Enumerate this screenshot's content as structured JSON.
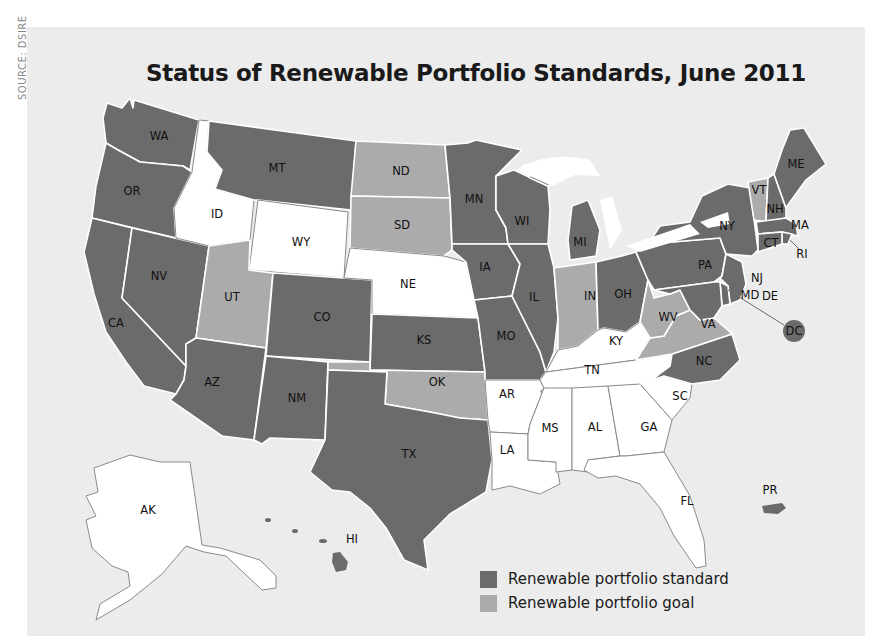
{
  "source": "SOURCE: DSIRE",
  "title": "Status of Renewable Portfolio Standards, June 2011",
  "colors": {
    "panel_background": "#ececec",
    "renewable_portfolio_standard": "#6b6b6b",
    "renewable_portfolio_goal": "#ababab",
    "no_policy": "#ffffff"
  },
  "legend": {
    "items": [
      {
        "label": "Renewable portfolio standard",
        "color": "#6b6b6b"
      },
      {
        "label": "Renewable portfolio goal",
        "color": "#ababab"
      }
    ]
  },
  "states": {
    "WA": {
      "label": "WA",
      "status": "standard"
    },
    "OR": {
      "label": "OR",
      "status": "standard"
    },
    "CA": {
      "label": "CA",
      "status": "standard"
    },
    "NV": {
      "label": "NV",
      "status": "standard"
    },
    "ID": {
      "label": "ID",
      "status": "none"
    },
    "MT": {
      "label": "MT",
      "status": "standard"
    },
    "WY": {
      "label": "WY",
      "status": "none"
    },
    "UT": {
      "label": "UT",
      "status": "goal"
    },
    "AZ": {
      "label": "AZ",
      "status": "standard"
    },
    "CO": {
      "label": "CO",
      "status": "standard"
    },
    "NM": {
      "label": "NM",
      "status": "standard"
    },
    "ND": {
      "label": "ND",
      "status": "goal"
    },
    "SD": {
      "label": "SD",
      "status": "goal"
    },
    "NE": {
      "label": "NE",
      "status": "none"
    },
    "KS": {
      "label": "KS",
      "status": "standard"
    },
    "OK": {
      "label": "OK",
      "status": "goal"
    },
    "TX": {
      "label": "TX",
      "status": "standard"
    },
    "MN": {
      "label": "MN",
      "status": "standard"
    },
    "IA": {
      "label": "IA",
      "status": "standard"
    },
    "MO": {
      "label": "MO",
      "status": "standard"
    },
    "AR": {
      "label": "AR",
      "status": "none"
    },
    "LA": {
      "label": "LA",
      "status": "none"
    },
    "WI": {
      "label": "WI",
      "status": "standard"
    },
    "IL": {
      "label": "IL",
      "status": "standard"
    },
    "MI": {
      "label": "MI",
      "status": "standard"
    },
    "IN": {
      "label": "IN",
      "status": "goal"
    },
    "OH": {
      "label": "OH",
      "status": "standard"
    },
    "KY": {
      "label": "KY",
      "status": "none"
    },
    "TN": {
      "label": "TN",
      "status": "none"
    },
    "MS": {
      "label": "MS",
      "status": "none"
    },
    "AL": {
      "label": "AL",
      "status": "none"
    },
    "GA": {
      "label": "GA",
      "status": "none"
    },
    "FL": {
      "label": "FL",
      "status": "none"
    },
    "SC": {
      "label": "SC",
      "status": "none"
    },
    "NC": {
      "label": "NC",
      "status": "standard"
    },
    "VA": {
      "label": "VA",
      "status": "goal"
    },
    "WV": {
      "label": "WV",
      "status": "goal"
    },
    "PA": {
      "label": "PA",
      "status": "standard"
    },
    "NY": {
      "label": "NY",
      "status": "standard"
    },
    "VT": {
      "label": "VT",
      "status": "goal"
    },
    "NH": {
      "label": "NH",
      "status": "standard"
    },
    "ME": {
      "label": "ME",
      "status": "standard"
    },
    "MA": {
      "label": "MA",
      "status": "standard"
    },
    "RI": {
      "label": "RI",
      "status": "standard"
    },
    "CT": {
      "label": "CT",
      "status": "standard"
    },
    "NJ": {
      "label": "NJ",
      "status": "standard"
    },
    "DE": {
      "label": "DE",
      "status": "standard"
    },
    "MD": {
      "label": "MD",
      "status": "standard"
    },
    "DC": {
      "label": "DC",
      "status": "standard"
    },
    "AK": {
      "label": "AK",
      "status": "none"
    },
    "HI": {
      "label": "HI",
      "status": "standard"
    },
    "PR": {
      "label": "PR",
      "status": "standard"
    }
  }
}
